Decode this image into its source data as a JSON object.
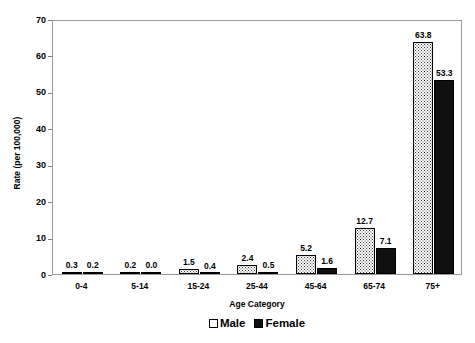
{
  "chart_data": {
    "type": "bar",
    "title": "",
    "xlabel": "Age Category",
    "ylabel": "Rate (per 100,000)",
    "categories": [
      "0-4",
      "5-14",
      "15-24",
      "25-44",
      "45-64",
      "65-74",
      "75+"
    ],
    "series": [
      {
        "name": "Male",
        "values": [
          0.3,
          0.2,
          1.5,
          2.4,
          5.2,
          12.7,
          63.8
        ],
        "labels": [
          "0.3",
          "0.2",
          "1.5",
          "2.4",
          "5.2",
          "12.7",
          "63.8"
        ],
        "fill": "dotted-white",
        "color": "#ffffff"
      },
      {
        "name": "Female",
        "values": [
          0.2,
          0.0,
          0.4,
          0.5,
          1.6,
          7.1,
          53.3
        ],
        "labels": [
          "0.2",
          "0.0",
          "0.4",
          "0.5",
          "1.6",
          "7.1",
          "53.3"
        ],
        "fill": "solid-black",
        "color": "#101010"
      }
    ],
    "ylim": [
      0,
      70
    ],
    "yticks": [
      0,
      10,
      20,
      30,
      40,
      50,
      60,
      70
    ],
    "ytick_labels": [
      "0",
      "10",
      "20",
      "30",
      "40",
      "50",
      "60",
      "70"
    ],
    "grid": false,
    "legend_position": "bottom",
    "legend_entries": [
      "Male",
      "Female"
    ]
  }
}
